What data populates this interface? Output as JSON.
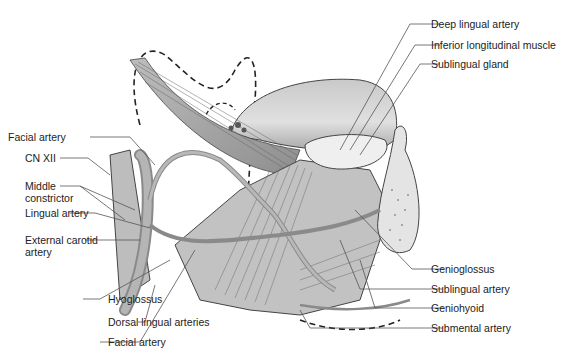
{
  "figure": {
    "colors": {
      "tissue_light": "#d8d8d8",
      "tissue_mid": "#b0b0b0",
      "tissue_dark": "#7a7a7a",
      "line": "#555555",
      "text": "#222222"
    }
  },
  "labels_left": [
    {
      "text": "Facial artery"
    },
    {
      "text": "CN XII"
    },
    {
      "text": "Middle constrictor"
    },
    {
      "text": "Lingual artery"
    },
    {
      "text": "External carotid artery"
    }
  ],
  "labels_bottom": [
    {
      "text": "Hyoglossus"
    },
    {
      "text": "Dorsal lingual arteries"
    },
    {
      "text": "Facial artery"
    }
  ],
  "labels_right_top": [
    {
      "text": "Deep lingual artery"
    },
    {
      "text": "Inferior longitudinal muscle"
    },
    {
      "text": "Sublingual gland"
    }
  ],
  "labels_right_bottom": [
    {
      "text": "Genioglossus"
    },
    {
      "text": "Sublingual artery"
    },
    {
      "text": "Geniohyoid"
    },
    {
      "text": "Submental artery"
    }
  ]
}
